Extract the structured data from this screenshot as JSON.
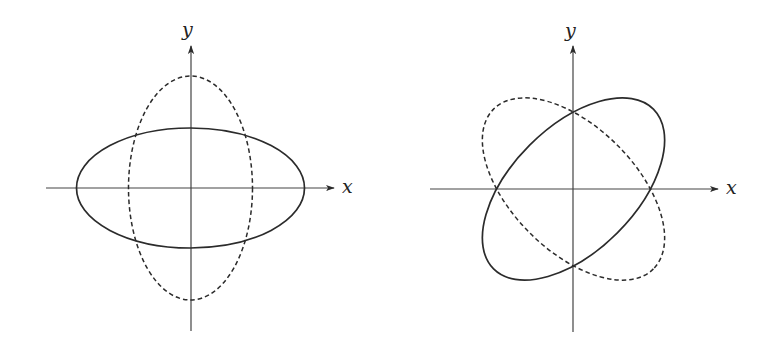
{
  "figure": {
    "panels": [
      {
        "id": "left",
        "description": "Axis-aligned ellipses",
        "x_axis_label": "x",
        "y_axis_label": "y",
        "solid_ellipse": {
          "style": "solid",
          "orientation": "horizontal major axis"
        },
        "dashed_ellipse": {
          "style": "dashed",
          "orientation": "vertical major axis"
        }
      },
      {
        "id": "right",
        "description": "Rotated ellipses (±45°)",
        "x_axis_label": "x",
        "y_axis_label": "y",
        "solid_ellipse": {
          "style": "solid",
          "orientation": "major axis tilted +45°"
        },
        "dashed_ellipse": {
          "style": "dashed",
          "orientation": "major axis tilted -45°"
        }
      }
    ],
    "colors": {
      "stroke": "#2b2b2b",
      "background": "#ffffff"
    }
  }
}
